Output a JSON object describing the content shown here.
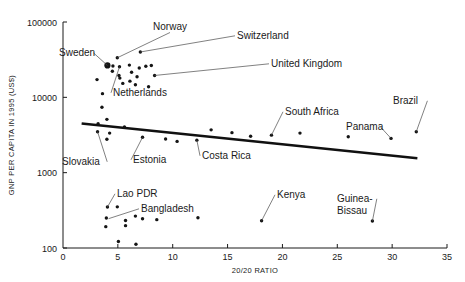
{
  "chart_data": {
    "type": "scatter",
    "title": "",
    "xlabel": "20/20 RATIO",
    "ylabel": "GNP PER CAPITA IN 1995 (US$)",
    "xlim": [
      0,
      35
    ],
    "ylim": [
      100,
      100000
    ],
    "yscale": "log",
    "xticks": [
      "0",
      "5",
      "10",
      "15",
      "20",
      "25",
      "30",
      "35"
    ],
    "xtick_values": [
      0,
      5,
      10,
      15,
      20,
      25,
      30,
      35
    ],
    "yticks": [
      "100",
      "1000",
      "10000",
      "100000"
    ],
    "ytick_values": [
      100,
      1000,
      10000,
      100000
    ],
    "grid": false,
    "legend": "none",
    "trendline": {
      "x": [
        1.7,
        32.3
      ],
      "y": [
        4500,
        1550
      ]
    },
    "annotations": [
      {
        "label": "Norway",
        "label_x": 170,
        "label_y": 30,
        "point_x": 4.95,
        "point_y": 33500,
        "anchor": "middle"
      },
      {
        "label": "Switzerland",
        "label_x": 237,
        "label_y": 39,
        "point_x": 7.05,
        "point_y": 40000,
        "anchor": "start"
      },
      {
        "label": "Sweden",
        "label_x": 59,
        "label_y": 56,
        "point_x": 4.05,
        "point_y": 26500,
        "anchor": "start"
      },
      {
        "label": "United Kingdom",
        "label_x": 271,
        "label_y": 67,
        "point_x": 8.35,
        "point_y": 19500,
        "anchor": "start"
      },
      {
        "label": "Netherlands",
        "label_x": 113,
        "label_y": 96,
        "point_x": 5.15,
        "point_y": 25500,
        "anchor": "start"
      },
      {
        "label": "South Africa",
        "label_x": 285,
        "label_y": 115,
        "point_x": 19.0,
        "point_y": 3150,
        "anchor": "start"
      },
      {
        "label": "Brazil",
        "label_x": 393,
        "label_y": 104,
        "point_x": 32.2,
        "point_y": 3500,
        "anchor": "start"
      },
      {
        "label": "Panama",
        "label_x": 346,
        "label_y": 130,
        "point_x": 29.9,
        "point_y": 2850,
        "anchor": "start"
      },
      {
        "label": "Slovakia",
        "label_x": 62,
        "label_y": 165,
        "point_x": 3.15,
        "point_y": 3500,
        "anchor": "start"
      },
      {
        "label": "Estonia",
        "label_x": 133,
        "label_y": 163,
        "point_x": 7.25,
        "point_y": 2950,
        "anchor": "start"
      },
      {
        "label": "Costa Rica",
        "label_x": 202,
        "label_y": 159,
        "point_x": 12.2,
        "point_y": 2700,
        "anchor": "start"
      },
      {
        "label": "Lao PDR",
        "label_x": 117,
        "label_y": 197,
        "point_x": 4.05,
        "point_y": 350,
        "anchor": "start"
      },
      {
        "label": "Bangladesh",
        "label_x": 141,
        "label_y": 212,
        "point_x": 4.15,
        "point_y": 245,
        "anchor": "start"
      },
      {
        "label": "Kenya",
        "label_x": 277,
        "label_y": 198,
        "point_x": 18.1,
        "point_y": 230,
        "anchor": "start"
      },
      {
        "label": "Guinea-",
        "label_x": 337,
        "label_y": 202,
        "point_x": 28.2,
        "point_y": 228,
        "anchor": "start"
      },
      {
        "label": "Bissau",
        "label_x": 337,
        "label_y": 214,
        "point_x": 28.2,
        "point_y": 228,
        "anchor": "start"
      }
    ],
    "points": [
      {
        "x": 4.05,
        "y": 26500,
        "marker": "big"
      },
      {
        "x": 4.95,
        "y": 33500
      },
      {
        "x": 4.55,
        "y": 26000
      },
      {
        "x": 4.5,
        "y": 22200
      },
      {
        "x": 5.15,
        "y": 25500
      },
      {
        "x": 5.1,
        "y": 19500
      },
      {
        "x": 5.18,
        "y": 18000
      },
      {
        "x": 5.45,
        "y": 15300
      },
      {
        "x": 6.05,
        "y": 26800
      },
      {
        "x": 6.25,
        "y": 21500
      },
      {
        "x": 6.1,
        "y": 16400
      },
      {
        "x": 6.6,
        "y": 14700
      },
      {
        "x": 6.95,
        "y": 24500
      },
      {
        "x": 6.75,
        "y": 18800
      },
      {
        "x": 7.05,
        "y": 40000
      },
      {
        "x": 7.55,
        "y": 25800
      },
      {
        "x": 8.05,
        "y": 26500
      },
      {
        "x": 8.35,
        "y": 19500
      },
      {
        "x": 7.8,
        "y": 13800
      },
      {
        "x": 3.1,
        "y": 17200
      },
      {
        "x": 3.6,
        "y": 11200
      },
      {
        "x": 3.55,
        "y": 7400
      },
      {
        "x": 4.0,
        "y": 5100
      },
      {
        "x": 3.2,
        "y": 4450
      },
      {
        "x": 3.15,
        "y": 3500
      },
      {
        "x": 4.25,
        "y": 3350
      },
      {
        "x": 4.0,
        "y": 2780
      },
      {
        "x": 5.6,
        "y": 4050
      },
      {
        "x": 7.25,
        "y": 2950
      },
      {
        "x": 9.35,
        "y": 2800
      },
      {
        "x": 10.4,
        "y": 2600
      },
      {
        "x": 12.2,
        "y": 2700
      },
      {
        "x": 13.5,
        "y": 3700
      },
      {
        "x": 15.4,
        "y": 3400
      },
      {
        "x": 17.1,
        "y": 3050
      },
      {
        "x": 19.0,
        "y": 3150
      },
      {
        "x": 21.6,
        "y": 3350
      },
      {
        "x": 26.0,
        "y": 3000
      },
      {
        "x": 29.9,
        "y": 2850
      },
      {
        "x": 32.2,
        "y": 3500
      },
      {
        "x": 4.05,
        "y": 350
      },
      {
        "x": 4.95,
        "y": 352
      },
      {
        "x": 3.95,
        "y": 250
      },
      {
        "x": 3.9,
        "y": 192
      },
      {
        "x": 5.7,
        "y": 232
      },
      {
        "x": 5.7,
        "y": 198
      },
      {
        "x": 6.6,
        "y": 265
      },
      {
        "x": 7.25,
        "y": 245
      },
      {
        "x": 8.55,
        "y": 238
      },
      {
        "x": 12.3,
        "y": 252
      },
      {
        "x": 5.05,
        "y": 122
      },
      {
        "x": 6.65,
        "y": 112
      },
      {
        "x": 18.1,
        "y": 230
      },
      {
        "x": 28.2,
        "y": 228
      }
    ]
  },
  "axes": {
    "x_title": "20/20 RATIO",
    "y_title": "GNP PER CAPITA IN 1995 (US$)"
  },
  "colors": {
    "point": "#151515",
    "trendline": "#111111",
    "axis": "#1a1a1a",
    "leader": "#4a4a4a",
    "background": "#ffffff"
  }
}
